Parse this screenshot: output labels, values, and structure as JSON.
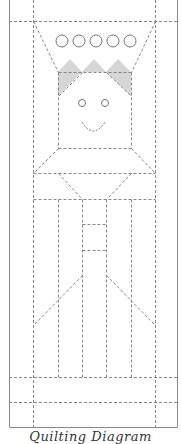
{
  "caption": "Quilting Diagram",
  "colors": {
    "background": "#ffffff",
    "frame": "#8a8a8a",
    "dash": "#7a7a7a",
    "hair_fill": "#d6d6d6",
    "circle_stroke": "#777777"
  },
  "figure": {
    "button_count": 5,
    "eye_count": 2
  }
}
